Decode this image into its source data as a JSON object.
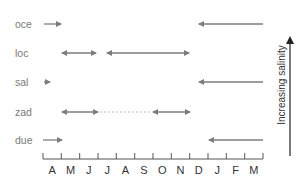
{
  "diagram": {
    "rows": [
      {
        "label": "oce",
        "y": 24
      },
      {
        "label": "loc",
        "y": 53
      },
      {
        "label": "sal",
        "y": 82
      },
      {
        "label": "zad",
        "y": 112
      },
      {
        "label": "due",
        "y": 140
      }
    ],
    "months": [
      "A",
      "M",
      "J",
      "J",
      "A",
      "S",
      "O",
      "N",
      "D",
      "J",
      "F",
      "M"
    ],
    "salinity_label": "Increasing salinity",
    "arrow_color": "#808080",
    "axis_color": "#555555"
  }
}
